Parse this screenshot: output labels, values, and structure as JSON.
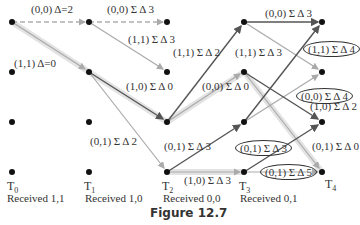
{
  "figure": {
    "caption": "Figure 12.7",
    "colors": {
      "dark_edge": "#555555",
      "light_edge": "#aaaaaa",
      "highlight": "#e0e0e0",
      "node": "#111111"
    },
    "time_steps": [
      {
        "label": "T",
        "sub": "0",
        "received": "Received 1,1"
      },
      {
        "label": "T",
        "sub": "1",
        "received": "Received 1,0"
      },
      {
        "label": "T",
        "sub": "2",
        "received": "Received 0,0"
      },
      {
        "label": "T",
        "sub": "3",
        "received": "Received 0,1"
      },
      {
        "label": "T",
        "sub": "4",
        "received": ""
      }
    ],
    "edge_labels": [
      "(0,0) Δ=2",
      "(1,1) Δ=0",
      "(0,0) Σ Δ 3",
      "(1,1) Σ Δ 3",
      "(1,0) Σ Δ 0",
      "(0,1) Σ Δ 2",
      "(1,1) Σ Δ 2",
      "(0,0) Σ Δ 0",
      "(0,1) Σ Δ 3",
      "(1,0) Σ Δ 3",
      "(0,0) Σ Δ 3",
      "(1,1) Σ Δ 3",
      "(1,1) Σ Δ 4",
      "(0,0) Σ Δ 4",
      "(1,0) Σ Δ 2",
      "(0,1) Σ Δ 3",
      "(0,1) Σ Δ 0",
      "(0,1) Σ Δ 5"
    ]
  }
}
